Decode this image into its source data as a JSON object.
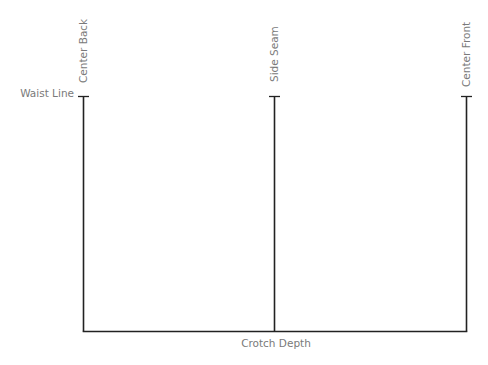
{
  "diagram": {
    "labels": {
      "waist_line": "Waist Line",
      "center_back": "Center Back",
      "side_seam": "Side Seam",
      "center_front": "Center Front",
      "crotch_depth": "Crotch Depth"
    },
    "colors": {
      "line": "#222222",
      "label": "#7a7a7a",
      "background": "#ffffff"
    }
  }
}
